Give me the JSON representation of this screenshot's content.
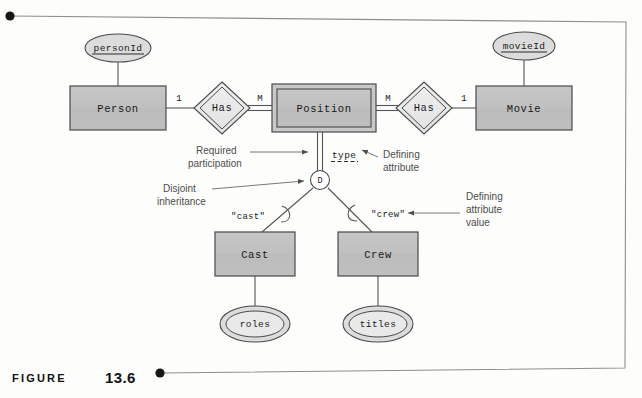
{
  "figure": {
    "word": "FIGURE",
    "number": "13.6"
  },
  "diagram": {
    "entities": [
      {
        "id": "person",
        "label": "Person",
        "type": "strong",
        "x": 70,
        "y": 86,
        "w": 96,
        "h": 44
      },
      {
        "id": "position",
        "label": "Position",
        "type": "weak",
        "x": 272,
        "y": 84,
        "w": 104,
        "h": 48
      },
      {
        "id": "movie",
        "label": "Movie",
        "type": "strong",
        "x": 476,
        "y": 86,
        "w": 96,
        "h": 44
      },
      {
        "id": "cast",
        "label": "Cast",
        "type": "strong",
        "x": 215,
        "y": 232,
        "w": 80,
        "h": 44
      },
      {
        "id": "crew",
        "label": "Crew",
        "type": "strong",
        "x": 338,
        "y": 232,
        "w": 80,
        "h": 44
      }
    ],
    "relationships": [
      {
        "id": "has-left",
        "label": "Has",
        "type": "identifying",
        "cx": 222,
        "cy": 108
      },
      {
        "id": "has-right",
        "label": "Has",
        "type": "identifying",
        "cx": 424,
        "cy": 108
      }
    ],
    "attributes": [
      {
        "id": "personid",
        "label": "personId",
        "kind": "key",
        "cx": 118,
        "cy": 48,
        "rx": 33,
        "ry": 14
      },
      {
        "id": "movieid",
        "label": "movieId",
        "kind": "key",
        "cx": 524,
        "cy": 46,
        "rx": 31,
        "ry": 14
      },
      {
        "id": "type",
        "label": "type",
        "kind": "defining",
        "x": 332,
        "y": 154
      },
      {
        "id": "roles",
        "label": "roles",
        "kind": "multivalued",
        "cx": 255,
        "cy": 324,
        "rx": 34,
        "ry": 17
      },
      {
        "id": "titles",
        "label": "titles",
        "kind": "multivalued",
        "cx": 378,
        "cy": 324,
        "rx": 34,
        "ry": 17
      }
    ],
    "cardinalities": [
      {
        "id": "person-has",
        "label": "1",
        "x": 179,
        "y": 100
      },
      {
        "id": "has-position",
        "label": "M",
        "x": 258,
        "y": 100
      },
      {
        "id": "position-has",
        "label": "M",
        "x": 385,
        "y": 100
      },
      {
        "id": "has-movie",
        "label": "1",
        "x": 465,
        "y": 100
      }
    ],
    "specialization": {
      "id": "disjoint-circle",
      "label": "D",
      "cx": 320,
      "cy": 180,
      "r": 9
    },
    "defining_values": [
      {
        "id": "cast-value",
        "label": "\"cast\"",
        "x": 231,
        "y": 216
      },
      {
        "id": "crew-value",
        "label": "\"crew\"",
        "x": 371,
        "y": 214
      }
    ],
    "annotations": [
      {
        "id": "required-participation",
        "line1": "Required",
        "line2": "participation",
        "x": 196,
        "y": 150
      },
      {
        "id": "defining-attribute",
        "line1": "Defining",
        "line2": "attribute",
        "x": 383,
        "y": 152
      },
      {
        "id": "disjoint-inheritance",
        "line1": "Disjoint",
        "line2": "inheritance",
        "x": 163,
        "y": 187
      },
      {
        "id": "defining-attribute-value",
        "line1": "Defining",
        "line2": "attribute",
        "line3": "value",
        "x": 466,
        "y": 188
      }
    ]
  },
  "colors": {
    "entity_fill": "#c2c2c2",
    "entity_fill_inner": "#bdbdbd",
    "relationship_fill": "#e6e6e6",
    "attribute_fill": "#d9d9d9",
    "attribute_fill_inner": "#e8e8e8",
    "stroke": "#4a4a4a",
    "text": "#1a1a1a",
    "annotation_text": "#4d4d4d",
    "frame": "#8a8a8a",
    "caption": "#111111"
  }
}
